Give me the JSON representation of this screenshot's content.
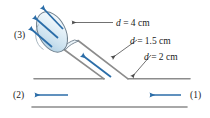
{
  "figure": {
    "type": "engineering-schematic",
    "width": 210,
    "height": 118,
    "background_color": "#ffffff"
  },
  "colors": {
    "pipe_wall": "#8c8c8c",
    "leader_line": "#4d4d4d",
    "flow_arrow": "#2b6da8",
    "nozzle_outline": "#6f7f8c",
    "nozzle_fill_light": "#f2f8fc",
    "nozzle_fill_mid": "#cfe3f0",
    "nozzle_fill_dark": "#a8cbe0",
    "text": "#1a1a1a"
  },
  "labels": {
    "station_3": "(3)",
    "station_2": "(2)",
    "station_1": "(1)",
    "diameter_nozzle_d": "d",
    "diameter_nozzle_eq": " = 4 cm",
    "diameter_branch_d": "d",
    "diameter_branch_eq": " = 1.5 cm",
    "diameter_main_d": "d",
    "diameter_main_eq": " = 2 cm"
  },
  "annotations": {
    "diameter_nozzle_full": "d = 4 cm",
    "diameter_branch_full": "d = 1.5 cm",
    "diameter_main_full": "d = 2 cm"
  },
  "flow": {
    "inlet_station": "(1)",
    "outlet_main_station": "(2)",
    "outlet_nozzle_station": "(3)",
    "inlet_direction": "leftward",
    "main_outlet_direction": "leftward",
    "branch_direction": "up-left",
    "nozzle_jet_direction": "up-left",
    "nozzle_jet_arrow_count": 3
  },
  "geometry": {
    "main_pipe_top_wall_left_y": 78.5,
    "main_pipe_bottom_wall_y": 107,
    "nozzle_center_x": 52,
    "nozzle_center_y": 32,
    "nozzle_rx": 13,
    "nozzle_ry": 21,
    "nozzle_rotation_deg": -27
  }
}
